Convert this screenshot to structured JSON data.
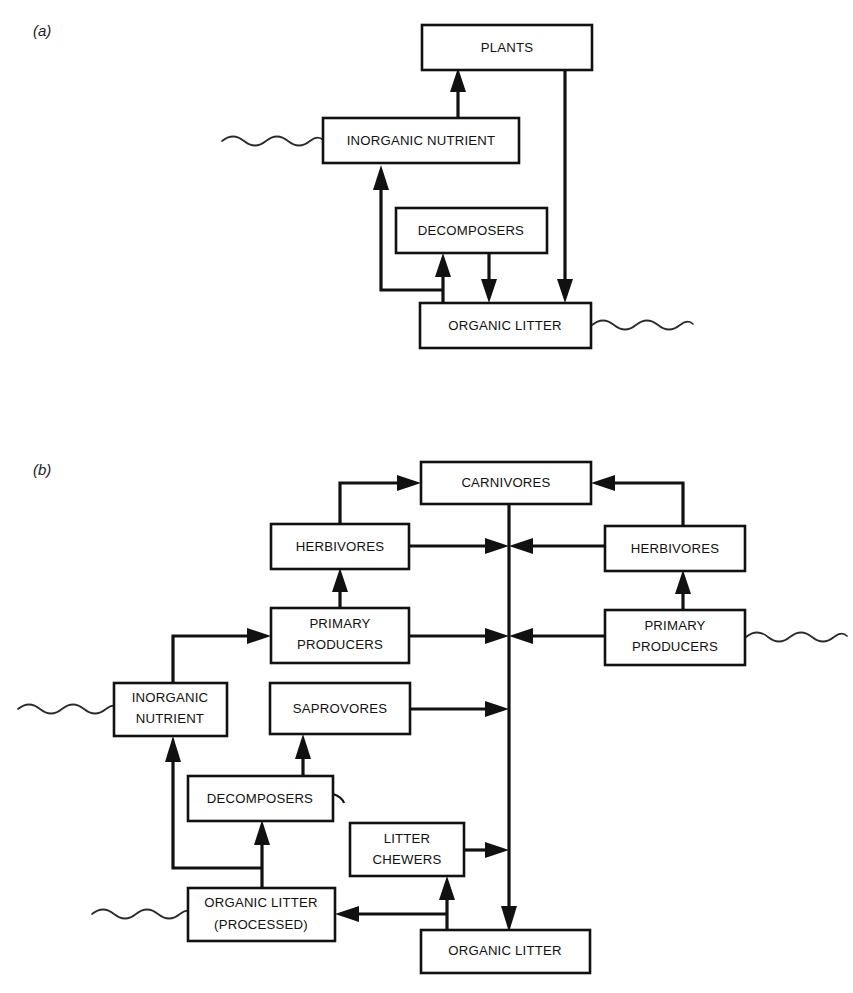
{
  "figure": {
    "background_color": "#ffffff",
    "line_color": "#111111",
    "panels": [
      {
        "id": "a",
        "label": "(a)",
        "description": "Simple decomposer nutrient cycle"
      },
      {
        "id": "b",
        "label": "(b)",
        "description": "Detritus-based and grazing food web with inorganic nutrient recycling"
      }
    ]
  },
  "panel_a": {
    "label": "(a)",
    "boxes": [
      {
        "id": "plants",
        "label": "PLANTS",
        "x": 422,
        "y": 25,
        "w": 170,
        "h": 45
      },
      {
        "id": "inorganic_nutrient",
        "label": "INORGANIC NUTRIENT",
        "x": 323,
        "y": 118,
        "w": 196,
        "h": 45
      },
      {
        "id": "decomposers",
        "label": "DECOMPOSERS",
        "x": 396,
        "y": 208,
        "w": 151,
        "h": 45
      },
      {
        "id": "organic_litter",
        "label": "ORGANIC LITTER",
        "x": 420,
        "y": 303,
        "w": 171,
        "h": 45
      }
    ],
    "flows": [
      {
        "from": "inorganic_nutrient",
        "to": "plants"
      },
      {
        "from": "plants",
        "to": "organic_litter"
      },
      {
        "from": "decomposers",
        "to": "organic_litter"
      },
      {
        "from": "organic_litter",
        "to": "decomposers"
      },
      {
        "from": "organic_litter",
        "to": "inorganic_nutrient"
      }
    ],
    "open_connections": [
      {
        "at": "inorganic_nutrient",
        "side": "left"
      },
      {
        "at": "organic_litter",
        "side": "right"
      }
    ]
  },
  "panel_b": {
    "label": "(b)",
    "boxes": [
      {
        "id": "carnivores",
        "label": "CARNIVORES",
        "x": 421,
        "y": 462,
        "w": 170,
        "h": 42
      },
      {
        "id": "herbivores_left",
        "label": "HERBIVORES",
        "x": 271,
        "y": 524,
        "w": 138,
        "h": 45
      },
      {
        "id": "herbivores_right",
        "label": "HERBIVORES",
        "x": 605,
        "y": 526,
        "w": 140,
        "h": 45
      },
      {
        "id": "primary_producers_left",
        "label_line1": "PRIMARY",
        "label_line2": "PRODUCERS",
        "x": 271,
        "y": 608,
        "w": 138,
        "h": 55
      },
      {
        "id": "primary_producers_right",
        "label_line1": "PRIMARY",
        "label_line2": "PRODUCERS",
        "x": 605,
        "y": 610,
        "w": 140,
        "h": 55
      },
      {
        "id": "inorganic_nutrient",
        "label_line1": "INORGANIC",
        "label_line2": "NUTRIENT",
        "x": 114,
        "y": 683,
        "w": 113,
        "h": 53
      },
      {
        "id": "saprovores",
        "label": "SAPROVORES",
        "x": 270,
        "y": 683,
        "w": 140,
        "h": 51
      },
      {
        "id": "decomposers",
        "label": "DECOMPOSERS",
        "x": 188,
        "y": 776,
        "w": 145,
        "h": 45
      },
      {
        "id": "litter_chewers",
        "label_line1": "LITTER",
        "label_line2": "CHEWERS",
        "x": 350,
        "y": 823,
        "w": 114,
        "h": 53
      },
      {
        "id": "organic_litter_processed",
        "label_line1": "ORGANIC LITTER",
        "label_line2": "(PROCESSED)",
        "x": 188,
        "y": 888,
        "w": 147,
        "h": 53
      },
      {
        "id": "organic_litter",
        "label": "ORGANIC LITTER",
        "x": 421,
        "y": 930,
        "w": 169,
        "h": 43
      }
    ],
    "flows": [
      {
        "from": "herbivores_left",
        "to": "carnivores"
      },
      {
        "from": "herbivores_right",
        "to": "carnivores"
      },
      {
        "from": "primary_producers_left",
        "to": "herbivores_left"
      },
      {
        "from": "primary_producers_right",
        "to": "herbivores_right"
      },
      {
        "from": "herbivores_left",
        "to": "detritus_column"
      },
      {
        "from": "herbivores_right",
        "to": "detritus_column"
      },
      {
        "from": "primary_producers_left",
        "to": "detritus_column"
      },
      {
        "from": "primary_producers_right",
        "to": "detritus_column"
      },
      {
        "from": "saprovores",
        "to": "detritus_column"
      },
      {
        "from": "litter_chewers",
        "to": "detritus_column"
      },
      {
        "from": "carnivores",
        "to": "organic_litter"
      },
      {
        "from": "organic_litter",
        "to": "litter_chewers"
      },
      {
        "from": "organic_litter",
        "to": "organic_litter_processed"
      },
      {
        "from": "organic_litter_processed",
        "to": "decomposers"
      },
      {
        "from": "organic_litter_processed",
        "to": "inorganic_nutrient"
      },
      {
        "from": "decomposers",
        "to": "saprovores"
      },
      {
        "from": "inorganic_nutrient",
        "to": "primary_producers_left"
      }
    ],
    "open_connections": [
      {
        "at": "inorganic_nutrient",
        "side": "left"
      },
      {
        "at": "primary_producers_right",
        "side": "right"
      },
      {
        "at": "organic_litter_processed",
        "side": "left"
      }
    ]
  }
}
